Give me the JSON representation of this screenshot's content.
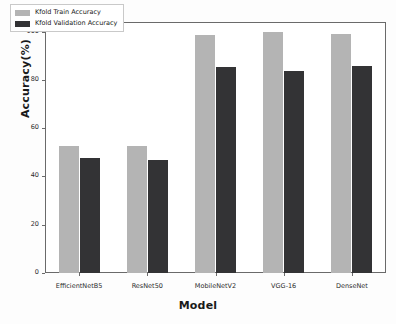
{
  "chart_data": {
    "type": "bar",
    "title": "",
    "xlabel": "Model",
    "ylabel": "Accuracy(%)",
    "categories": [
      "EfficientNetB5",
      "ResNet50",
      "MobileNetV2",
      "VGG-16",
      "DenseNet"
    ],
    "series": [
      {
        "name": "Kfold Train Accuracy",
        "color": "#b4b4b4",
        "values": [
          52.5,
          52.5,
          98.8,
          99.7,
          99.0
        ]
      },
      {
        "name": "Kfold Validation Accuracy",
        "color": "#333335",
        "values": [
          47.6,
          46.8,
          85.3,
          83.9,
          85.7
        ]
      }
    ],
    "ylim": [
      0,
      104
    ],
    "yticks": [
      0,
      20,
      40,
      60,
      80,
      100
    ],
    "ytick_labels": [
      "0",
      "20",
      "40",
      "60",
      "80",
      "100"
    ],
    "grid": false,
    "legend_position": "upper left"
  },
  "legend": {
    "entries": [
      {
        "label": "Kfold Train Accuracy",
        "swatch": "legend-swatch-train"
      },
      {
        "label": "Kfold Validation Accuracy",
        "swatch": "legend-swatch-validation"
      }
    ]
  },
  "axes": {
    "x_title": "Model",
    "y_title": "Accuracy(%)"
  }
}
